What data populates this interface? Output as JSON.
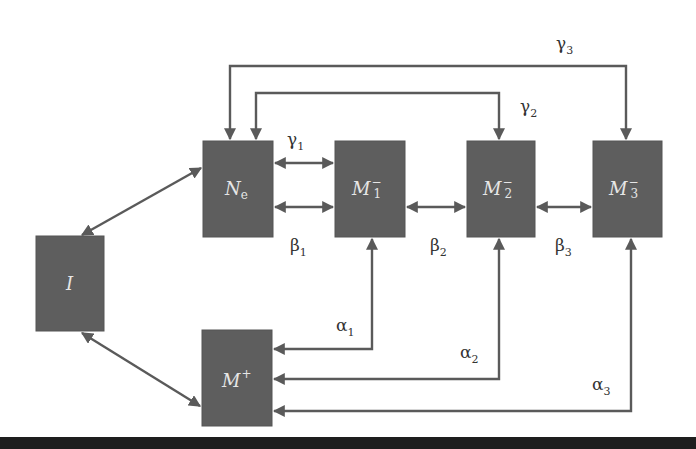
{
  "diagram": {
    "nodes": {
      "I": {
        "label": "I"
      },
      "Ne": {
        "label": "N",
        "sub": "e"
      },
      "M1": {
        "label": "M",
        "sub": "1",
        "sup": "−"
      },
      "M2": {
        "label": "M",
        "sub": "2",
        "sup": "−"
      },
      "M3": {
        "label": "M",
        "sub": "3",
        "sup": "−"
      },
      "Mplus": {
        "label": "M",
        "sup": "+"
      }
    },
    "edges": {
      "gamma1": {
        "sym": "γ",
        "sub": "1"
      },
      "gamma2": {
        "sym": "γ",
        "sub": "2"
      },
      "gamma3": {
        "sym": "γ",
        "sub": "3"
      },
      "beta1": {
        "sym": "β",
        "sub": "1"
      },
      "beta2": {
        "sym": "β",
        "sub": "2"
      },
      "beta3": {
        "sym": "β",
        "sub": "3"
      },
      "alpha1": {
        "sym": "α",
        "sub": "1"
      },
      "alpha2": {
        "sym": "α",
        "sub": "2"
      },
      "alpha3": {
        "sym": "α",
        "sub": "3"
      }
    },
    "colors": {
      "box": "#5e5e5e",
      "edge": "#5a5a5a",
      "box_text": "#e6e6e6",
      "label_text": "#333333",
      "footer": "#1e1e1e"
    }
  }
}
